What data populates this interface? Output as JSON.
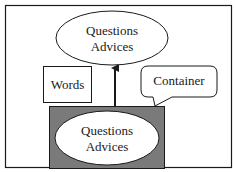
{
  "diagram": {
    "top_ellipse": {
      "line1": "Questions",
      "line2": "Advices"
    },
    "words_box": {
      "label": "Words"
    },
    "callout": {
      "label": "Container"
    },
    "container_box": {
      "fill": "#7a7a7a",
      "inner_ellipse": {
        "line1": "Questions",
        "line2": "Advices"
      }
    },
    "colors": {
      "stroke": "#1a1a1a",
      "background": "#ffffff",
      "container_fill": "#7a7a7a"
    }
  }
}
